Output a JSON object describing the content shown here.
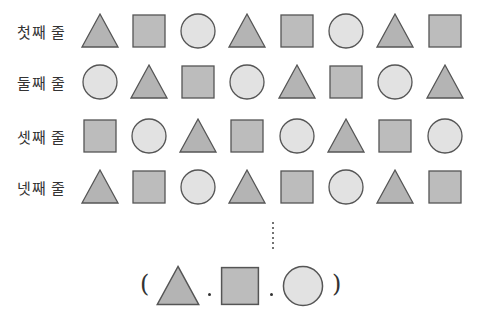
{
  "colors": {
    "triangle": "#b4b4b4",
    "square": "#bcbcbc",
    "circle": "#e2e2e2",
    "stroke": "#555555"
  },
  "rows": [
    {
      "label": "첫째 줄",
      "shapes": [
        "triangle",
        "square",
        "circle",
        "triangle",
        "square",
        "circle",
        "triangle",
        "square"
      ]
    },
    {
      "label": "둘째 줄",
      "shapes": [
        "circle",
        "triangle",
        "square",
        "circle",
        "triangle",
        "square",
        "circle",
        "triangle"
      ]
    },
    {
      "label": "셋째 줄",
      "shapes": [
        "square",
        "circle",
        "triangle",
        "square",
        "circle",
        "triangle",
        "square",
        "circle"
      ]
    },
    {
      "label": "넷째 줄",
      "shapes": [
        "triangle",
        "square",
        "circle",
        "triangle",
        "square",
        "circle",
        "triangle",
        "square"
      ]
    }
  ],
  "continuation": "⋮",
  "answer": {
    "open": "(",
    "close": ")",
    "shapes": [
      "triangle",
      "square",
      "circle"
    ]
  }
}
